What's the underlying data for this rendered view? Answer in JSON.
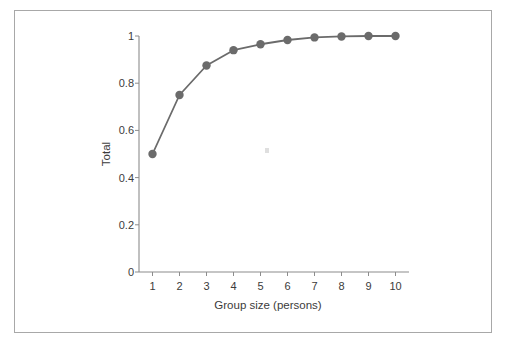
{
  "figure": {
    "background_color": "#ffffff",
    "frame_color": "#a8a8a8",
    "x_axis_title": "Group size (persons)",
    "y_axis_title": "Total"
  },
  "chart_data": {
    "type": "line",
    "title": "",
    "subtitle": "",
    "xlabel": "Group size (persons)",
    "ylabel": "Total",
    "x": [
      1,
      2,
      3,
      4,
      5,
      6,
      7,
      8,
      9,
      10
    ],
    "values": [
      0.5,
      0.75,
      0.875,
      0.94,
      0.965,
      0.983,
      0.994,
      0.998,
      1.0,
      1.0
    ],
    "series": [
      {
        "name": "Total",
        "values": [
          0.5,
          0.75,
          0.875,
          0.94,
          0.965,
          0.983,
          0.994,
          0.998,
          1.0,
          1.0
        ]
      }
    ],
    "xlim": [
      0.5,
      10.5
    ],
    "ylim": [
      0,
      1
    ],
    "x_ticks": [
      1,
      2,
      3,
      4,
      5,
      6,
      7,
      8,
      9,
      10
    ],
    "x_tick_labels": [
      "1",
      "2",
      "3",
      "4",
      "5",
      "6",
      "7",
      "8",
      "9",
      "10"
    ],
    "y_ticks": [
      0,
      0.2,
      0.4,
      0.6,
      0.8,
      1
    ],
    "y_tick_labels": [
      "0",
      "0.2",
      "0.4",
      "0.6",
      "0.8",
      "1"
    ],
    "grid": false,
    "legend": false,
    "legend_position": "none",
    "marker": "circle",
    "marker_color": "#6b6b6b",
    "line_color": "#6b6b6b",
    "axis_color": "#8c8c8c",
    "tick_direction": "out",
    "annotations": []
  }
}
